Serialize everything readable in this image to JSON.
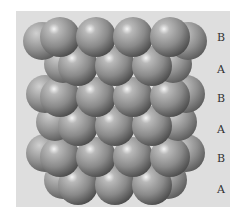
{
  "figure": {
    "title": "",
    "panel_color": "#dedede",
    "sphere_color": "#8a8a8a",
    "highlight_color": "#f4f4f4",
    "shadow_color": "#4a4a4a"
  },
  "layers": [
    {
      "label": "B",
      "label_y": 32,
      "center_y": 37,
      "front_x": [
        60,
        96,
        133,
        170
      ],
      "back_x": [
        42,
        188
      ],
      "back_dy": 4
    },
    {
      "label": "A",
      "label_y": 64,
      "center_y": 66,
      "front_x": [
        78,
        115,
        152
      ],
      "back_x": [
        63,
        173
      ],
      "back_dy": -2
    },
    {
      "label": "B",
      "label_y": 93,
      "center_y": 97,
      "front_x": [
        60,
        96,
        133,
        170
      ],
      "back_x": [
        45,
        186
      ],
      "back_dy": -3
    },
    {
      "label": "A",
      "label_y": 124,
      "center_y": 126,
      "front_x": [
        78,
        115,
        152
      ],
      "back_x": [
        55,
        178
      ],
      "back_dy": -4
    },
    {
      "label": "B",
      "label_y": 153,
      "center_y": 157,
      "front_x": [
        60,
        96,
        133,
        170
      ],
      "back_x": [
        45,
        186
      ],
      "back_dy": -4
    },
    {
      "label": "A",
      "label_y": 184,
      "center_y": 185,
      "front_x": [
        78,
        115,
        152
      ],
      "back_x": [
        63,
        168
      ],
      "back_dy": -5
    }
  ],
  "sphere_radius": 20
}
